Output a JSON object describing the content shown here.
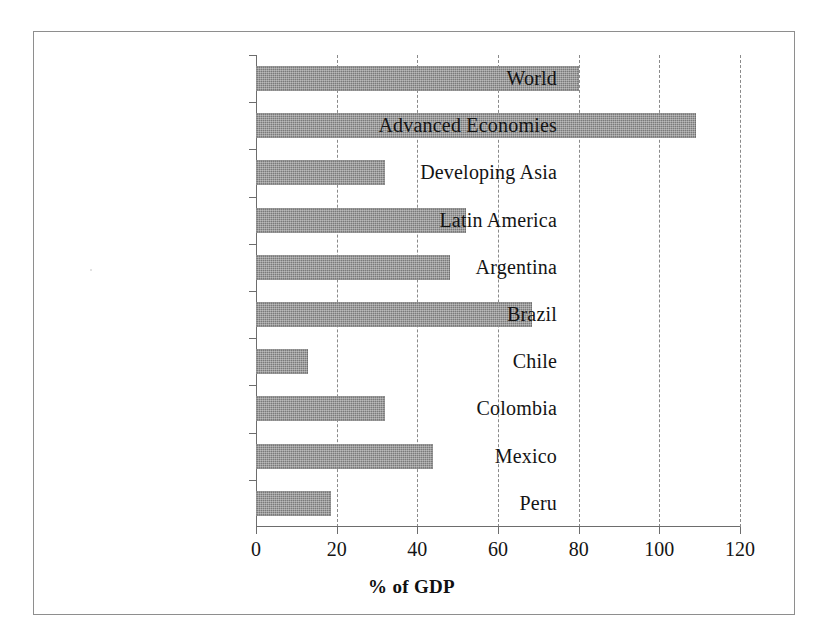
{
  "figure": {
    "axis_title": "% of GDP",
    "frame_color": "#8e8e8e",
    "bar_color": "#7a7a7a",
    "gridline_color": "#8a8a8a",
    "axis_color": "#6d6d6d"
  },
  "chart_data": {
    "type": "bar",
    "orientation": "horizontal",
    "title": "",
    "subtitle": "",
    "xlabel": "% of GDP",
    "ylabel": "",
    "xlim": [
      0,
      120
    ],
    "xticks": [
      0,
      20,
      40,
      60,
      80,
      100,
      120
    ],
    "xtick_labels": [
      "0",
      "20",
      "40",
      "60",
      "80",
      "100",
      "120"
    ],
    "grid": "vertical dashed gridlines at 20,40,60,80,100,120",
    "legend": "none",
    "categories": [
      "World",
      "Advanced Economies",
      "Developing Asia",
      "Latin America",
      "Argentina",
      "Brazil",
      "Chile",
      "Colombia",
      "Mexico",
      "Peru"
    ],
    "values": [
      80,
      109,
      32,
      52,
      48,
      68.5,
      13,
      32,
      44,
      18.5
    ],
    "units": "percent of GDP"
  }
}
